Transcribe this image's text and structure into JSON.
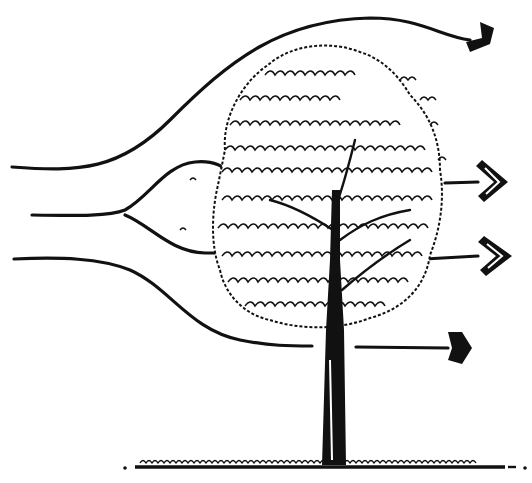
{
  "figure": {
    "colors": {
      "ink": "#111111",
      "background": "#ffffff"
    },
    "elements": {
      "streamlines": [
        {
          "id": "top",
          "arrow": "solid",
          "path": "deflected over canopy"
        },
        {
          "id": "upper-middle",
          "arrow": "hollow-double",
          "path": "passes through upper canopy"
        },
        {
          "id": "lower-middle",
          "arrow": "hollow-double",
          "path": "passes through lower canopy"
        },
        {
          "id": "bottom",
          "arrow": "solid",
          "path": "passes under canopy along trunk"
        }
      ],
      "tree": {
        "parts": [
          "canopy",
          "trunk",
          "branches"
        ]
      },
      "ground": {
        "type": "grass line"
      }
    }
  }
}
